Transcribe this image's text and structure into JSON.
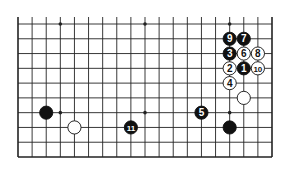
{
  "diagram": {
    "type": "go-board-fragment",
    "columns": 19,
    "rows": 10,
    "open_top": true,
    "colors": {
      "line": "#222222",
      "black_stone": "#111111",
      "white_stone": "#ffffff",
      "background": "#ffffff"
    },
    "star_points": [
      {
        "col": 3,
        "row": 0
      },
      {
        "col": 9,
        "row": 0
      },
      {
        "col": 15,
        "row": 0
      },
      {
        "col": 3,
        "row": 6
      },
      {
        "col": 9,
        "row": 6
      },
      {
        "col": 15,
        "row": 6
      }
    ],
    "stones": [
      {
        "color": "black",
        "col": 16,
        "row": 3,
        "label": "1"
      },
      {
        "color": "white",
        "col": 15,
        "row": 3,
        "label": "2"
      },
      {
        "color": "black",
        "col": 15,
        "row": 2,
        "label": "3"
      },
      {
        "color": "white",
        "col": 15,
        "row": 4,
        "label": "4"
      },
      {
        "color": "black",
        "col": 13,
        "row": 6,
        "label": "5"
      },
      {
        "color": "white",
        "col": 16,
        "row": 2,
        "label": "6"
      },
      {
        "color": "black",
        "col": 16,
        "row": 1,
        "label": "7"
      },
      {
        "color": "white",
        "col": 17,
        "row": 2,
        "label": "8"
      },
      {
        "color": "black",
        "col": 15,
        "row": 1,
        "label": "9"
      },
      {
        "color": "white",
        "col": 17,
        "row": 3,
        "label": "10"
      },
      {
        "color": "black",
        "col": 8,
        "row": 7,
        "label": "11"
      },
      {
        "color": "black",
        "col": 2,
        "row": 6,
        "label": ""
      },
      {
        "color": "white",
        "col": 4,
        "row": 7,
        "label": ""
      },
      {
        "color": "black",
        "col": 15,
        "row": 7,
        "label": ""
      },
      {
        "color": "white",
        "col": 16,
        "row": 5,
        "label": ""
      }
    ]
  }
}
